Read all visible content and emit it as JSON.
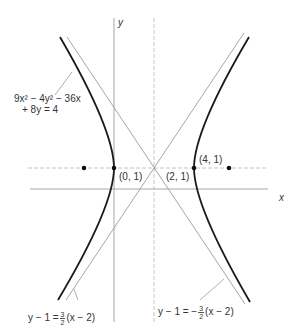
{
  "figure": {
    "equation_line1": "9x² − 4y² − 36x",
    "equation_line2": "+ 8y = 4",
    "axis_labels": {
      "x": "x",
      "y": "y"
    },
    "points": [
      {
        "label": "(0, 1)",
        "role": "vertex"
      },
      {
        "label": "(2, 1)",
        "role": "center"
      },
      {
        "label": "(4, 1)",
        "role": "vertex"
      }
    ],
    "asymptote_left": {
      "lhs": "y − 1 =",
      "num": "3",
      "den": "2",
      "rhs": "(x − 2)"
    },
    "asymptote_right": {
      "lhs": "y − 1 = −",
      "num": "3",
      "den": "2",
      "rhs": "(x − 2)"
    },
    "colors": {
      "curve": "#1a1a1a",
      "asymptote": "#9a9a9a",
      "axis": "#a8a8a8",
      "text": "#333333"
    }
  }
}
